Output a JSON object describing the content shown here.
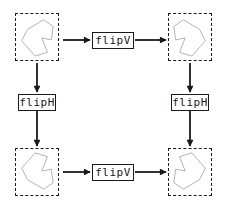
{
  "colors": {
    "line": "#1a1a1a",
    "shape_outline": "#b0b0b0",
    "background": "#ffffff"
  },
  "operations": {
    "top": {
      "label": "flipV"
    },
    "left": {
      "label": "flipH"
    },
    "right": {
      "label": "flipH"
    },
    "bottom": {
      "label": "flipV"
    }
  }
}
